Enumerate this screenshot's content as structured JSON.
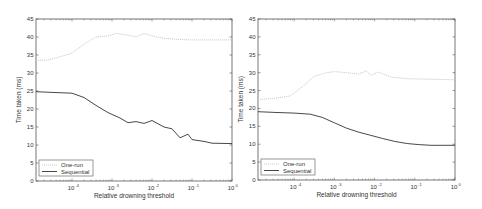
{
  "chart_data": [
    {
      "type": "line",
      "title": "",
      "xlabel": "Relative drowning threshold",
      "ylabel": "Time taken (ms)",
      "xscale": "log",
      "xlim": [
        1.26e-05,
        1
      ],
      "ylim": [
        0,
        45
      ],
      "yticks": [
        0,
        5,
        10,
        15,
        20,
        25,
        30,
        35,
        40,
        45
      ],
      "xticks": [
        "10^-4",
        "10^-3",
        "10^-2",
        "10^-1",
        "10^0"
      ],
      "legend": {
        "position": "lower left",
        "entries": [
          "One-run",
          "Sequential"
        ]
      },
      "series": [
        {
          "name": "One-run",
          "style": "dotted light gray",
          "x_log10": [
            -4.9,
            -4.6,
            -4.3,
            -4.0,
            -3.7,
            -3.4,
            -3.1,
            -2.9,
            -2.6,
            -2.4,
            -2.2,
            -2.0,
            -1.7,
            -1.3,
            -1.0,
            -0.6,
            0.0
          ],
          "values": [
            33.5,
            33.6,
            34.5,
            35.5,
            38.0,
            40.0,
            40.3,
            41.0,
            40.5,
            40.0,
            41.0,
            40.3,
            39.6,
            39.3,
            39.2,
            39.2,
            39.2
          ]
        },
        {
          "name": "Sequential",
          "style": "solid dark gray",
          "x_log10": [
            -4.9,
            -4.5,
            -4.0,
            -3.7,
            -3.4,
            -3.1,
            -2.8,
            -2.6,
            -2.4,
            -2.2,
            -2.0,
            -1.7,
            -1.5,
            -1.3,
            -1.1,
            -1.0,
            -0.7,
            -0.5,
            0.0
          ],
          "values": [
            24.8,
            24.6,
            24.4,
            23.2,
            21.0,
            19.0,
            17.5,
            16.2,
            16.5,
            16.0,
            16.8,
            15.0,
            14.5,
            12.0,
            13.0,
            11.5,
            11.0,
            10.5,
            10.4
          ]
        }
      ]
    },
    {
      "type": "line",
      "title": "",
      "xlabel": "Relative drowning threshold",
      "ylabel": "Time taken (ms)",
      "xscale": "log",
      "xlim": [
        1.26e-05,
        1
      ],
      "ylim": [
        0,
        45
      ],
      "yticks": [
        0,
        5,
        10,
        15,
        20,
        25,
        30,
        35,
        40,
        45
      ],
      "xticks": [
        "10^-4",
        "10^-3",
        "10^-2",
        "10^-1",
        "10^0"
      ],
      "legend": {
        "position": "lower left",
        "entries": [
          "One-run",
          "Sequential"
        ]
      },
      "series": [
        {
          "name": "One-run",
          "style": "dotted light gray",
          "x_log10": [
            -4.9,
            -4.5,
            -4.1,
            -3.8,
            -3.5,
            -3.2,
            -3.0,
            -2.7,
            -2.4,
            -2.2,
            -2.1,
            -1.9,
            -1.6,
            -1.2,
            -0.8,
            0.0
          ],
          "values": [
            22.5,
            22.8,
            23.5,
            26.0,
            29.0,
            30.0,
            30.3,
            30.0,
            29.6,
            30.5,
            29.2,
            30.2,
            28.8,
            28.3,
            28.2,
            28.0
          ]
        },
        {
          "name": "Sequential",
          "style": "solid dark gray",
          "x_log10": [
            -4.9,
            -4.5,
            -4.0,
            -3.6,
            -3.3,
            -3.0,
            -2.7,
            -2.4,
            -2.1,
            -1.8,
            -1.5,
            -1.2,
            -0.9,
            -0.6,
            -0.3,
            0.0
          ],
          "values": [
            19.1,
            18.9,
            18.7,
            18.4,
            17.5,
            16.0,
            14.5,
            13.4,
            12.5,
            11.6,
            10.8,
            10.2,
            9.9,
            9.7,
            9.7,
            9.7
          ]
        }
      ]
    }
  ]
}
